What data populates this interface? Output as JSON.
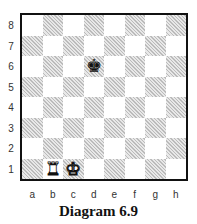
{
  "diagram": {
    "caption": "Diagram 6.9",
    "ranks": [
      "8",
      "7",
      "6",
      "5",
      "4",
      "3",
      "2",
      "1"
    ],
    "files": [
      "a",
      "b",
      "c",
      "d",
      "e",
      "f",
      "g",
      "h"
    ],
    "pieces": [
      {
        "square": "b1",
        "piece": "rook",
        "color": "white",
        "glyph": "♜"
      },
      {
        "square": "c1",
        "piece": "king",
        "color": "white",
        "glyph": "♚"
      },
      {
        "square": "d6",
        "piece": "king",
        "color": "black",
        "glyph": "♚"
      }
    ],
    "colors": {
      "border": "#111111",
      "light": "#ffffff",
      "dark": "#cccccc"
    }
  }
}
